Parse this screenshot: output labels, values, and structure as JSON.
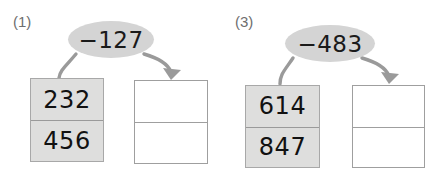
{
  "page": {
    "background_color": "#ffffff",
    "width": 443,
    "height": 184
  },
  "colors": {
    "bubble_fill": "#d4d4d4",
    "filled_box_fill": "#dededd",
    "box_border": "#9a9a9a",
    "arrow_stroke": "#9a9a9a",
    "text": "#111111",
    "label_text": "#6e6e6e"
  },
  "problems": [
    {
      "number_label": "(1)",
      "operation": "−127",
      "source_box": {
        "type": "filled",
        "cells": [
          "232",
          "456"
        ]
      },
      "result_box": {
        "type": "empty",
        "cells": [
          "",
          ""
        ]
      },
      "connector_plain": "curve-from-bubble-to-source-box",
      "connector_arrow": "curve-from-bubble-to-result-box"
    },
    {
      "number_label": "(3)",
      "operation": "−483",
      "source_box": {
        "type": "filled",
        "cells": [
          "614",
          "847"
        ]
      },
      "result_box": {
        "type": "empty",
        "cells": [
          "",
          ""
        ]
      },
      "connector_plain": "curve-from-bubble-to-source-box",
      "connector_arrow": "curve-from-bubble-to-result-box"
    }
  ]
}
